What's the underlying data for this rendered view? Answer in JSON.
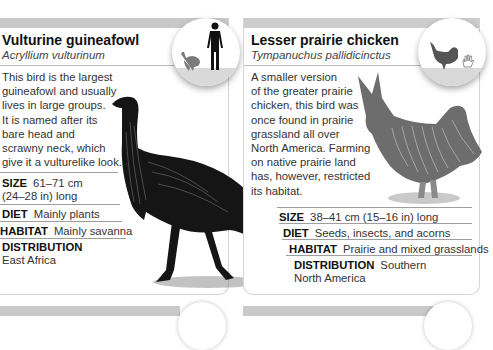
{
  "cards": [
    {
      "title": "Vulturine guineafowl",
      "latin_name": "Acryllium vulturinum",
      "description_lines": [
        "This bird is the largest",
        "guineafowl and usually",
        "lives in large groups.",
        "It is named after its",
        "bare head and",
        "scrawny neck, which",
        "give it a vulturelike look."
      ],
      "facts": {
        "size_label": "SIZE",
        "size_value_1": "61–71 cm",
        "size_value_2": "(24–28 in) long",
        "diet_label": "DIET",
        "diet_value": "Mainly plants",
        "habitat_label": "HABITAT",
        "habitat_value": "Mainly savanna",
        "distribution_label": "DISTRIBUTION",
        "distribution_value": "East Africa"
      },
      "scale_icons": [
        "guineafowl-silhouette-icon",
        "human-silhouette-icon"
      ]
    },
    {
      "title": "Lesser prairie chicken",
      "latin_name": "Tympanuchus pallidicinctus",
      "description_lines": [
        "A smaller version",
        "of the greater prairie",
        "chicken, this bird was",
        "once found in prairie",
        "grassland all over",
        "North America. Farming",
        "on native prairie land",
        "has, however, restricted",
        "its habitat."
      ],
      "facts": {
        "size_label": "SIZE",
        "size_value": "38–41 cm (15–16 in) long",
        "diet_label": "DIET",
        "diet_value": "Seeds, insects, and acorns",
        "habitat_label": "HABITAT",
        "habitat_value": "Prairie and mixed grasslands",
        "distribution_label": "DISTRIBUTION",
        "distribution_value_1": "Southern",
        "distribution_value_2": "North America"
      },
      "scale_icons": [
        "prairie-chicken-silhouette-icon",
        "hand-icon"
      ]
    }
  ],
  "colors": {
    "header_bar": "#c8c8c8",
    "scale_floor": "#d9d9d9",
    "silhouette_dark": "#111111",
    "silhouette_gray": "#555555"
  }
}
